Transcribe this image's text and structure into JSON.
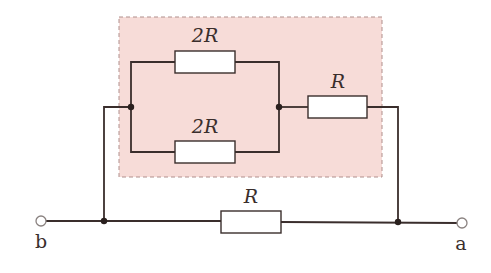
{
  "diagram": {
    "type": "circuit",
    "highlight_box": {
      "color": "#f7dcd8",
      "border": "#b08f8c",
      "style": "dashed"
    },
    "resistors": [
      {
        "id": "top-parallel",
        "label": "2R"
      },
      {
        "id": "bottom-parallel",
        "label": "2R"
      },
      {
        "id": "series-in-box",
        "label": "R"
      },
      {
        "id": "bottom-direct",
        "label": "R"
      }
    ],
    "terminals": [
      {
        "id": "b",
        "label": "b"
      },
      {
        "id": "a",
        "label": "a"
      }
    ]
  }
}
